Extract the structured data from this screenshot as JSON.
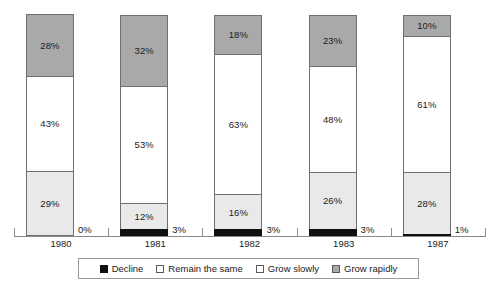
{
  "chart_data": {
    "type": "bar",
    "subtype": "stacked-bar-100-percent",
    "title": "",
    "subtitle": "",
    "xlabel": "",
    "ylabel": "",
    "ylim": [
      0,
      100
    ],
    "grid": false,
    "legend_position": "bottom",
    "categories": [
      "1980",
      "1981",
      "1982",
      "1983",
      "1987"
    ],
    "series": [
      {
        "name": "Decline",
        "color": "#101010",
        "values": [
          0,
          3,
          3,
          3,
          1
        ],
        "labels": [
          "0%",
          "3%",
          "3%",
          "3%",
          "1%"
        ]
      },
      {
        "name": "Remain the same",
        "color": "#e9e9e9",
        "values": [
          29,
          12,
          16,
          26,
          28
        ],
        "labels": [
          "29%",
          "12%",
          "16%",
          "26%",
          "28%"
        ]
      },
      {
        "name": "Grow slowly",
        "color": "#ffffff",
        "values": [
          43,
          53,
          63,
          48,
          61
        ],
        "labels": [
          "43%",
          "53%",
          "63%",
          "48%",
          "61%"
        ]
      },
      {
        "name": "Grow rapidly",
        "color": "#a9a9a9",
        "values": [
          28,
          32,
          18,
          23,
          10
        ],
        "labels": [
          "28%",
          "32%",
          "18%",
          "23%",
          "10%"
        ]
      }
    ]
  },
  "axis": {
    "categories": [
      "1980",
      "1981",
      "1982",
      "1983",
      "1987"
    ],
    "baseline_color": "#8a8a8a"
  },
  "legend": {
    "items": [
      {
        "label": "Decline",
        "swatch": "legend-swatch-decline"
      },
      {
        "label": "Remain the same",
        "swatch": "legend-swatch-remain-the-same"
      },
      {
        "label": "Grow slowly",
        "swatch": "legend-swatch-grow-slowly"
      },
      {
        "label": "Grow rapidly",
        "swatch": "legend-swatch-grow-rapidly"
      }
    ]
  },
  "bars": [
    {
      "category": "1980",
      "decline_label": "0%",
      "segments": [
        {
          "series": "Grow rapidly",
          "label": "28%"
        },
        {
          "series": "Grow slowly",
          "label": "43%"
        },
        {
          "series": "Remain the same",
          "label": "29%"
        }
      ]
    },
    {
      "category": "1981",
      "decline_label": "3%",
      "segments": [
        {
          "series": "Grow rapidly",
          "label": "32%"
        },
        {
          "series": "Grow slowly",
          "label": "53%"
        },
        {
          "series": "Remain the same",
          "label": "12%"
        }
      ]
    },
    {
      "category": "1982",
      "decline_label": "3%",
      "segments": [
        {
          "series": "Grow rapidly",
          "label": "18%"
        },
        {
          "series": "Grow slowly",
          "label": "63%"
        },
        {
          "series": "Remain the same",
          "label": "16%"
        }
      ]
    },
    {
      "category": "1983",
      "decline_label": "3%",
      "segments": [
        {
          "series": "Grow rapidly",
          "label": "23%"
        },
        {
          "series": "Grow slowly",
          "label": "48%"
        },
        {
          "series": "Remain the same",
          "label": "26%"
        }
      ]
    },
    {
      "category": "1987",
      "decline_label": "1%",
      "segments": [
        {
          "series": "Grow rapidly",
          "label": "10%"
        },
        {
          "series": "Grow slowly",
          "label": "61%"
        },
        {
          "series": "Remain the same",
          "label": "28%"
        }
      ]
    }
  ]
}
